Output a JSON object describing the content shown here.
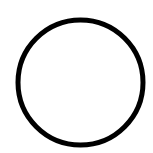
{
  "canvas": {
    "width": 153,
    "height": 153,
    "background": "#ffffff"
  },
  "shape": {
    "type": "circle",
    "icon": "circle-outline-icon",
    "cx": 80.5,
    "cy": 82.5,
    "r": 62.5,
    "stroke_width": 5,
    "stroke": "#000000",
    "fill": "none"
  }
}
